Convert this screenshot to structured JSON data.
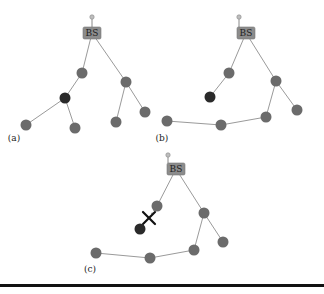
{
  "figure": {
    "panels": [
      {
        "id": "a",
        "label": "(a)",
        "label_pos": [
          14,
          141
        ],
        "bs": {
          "label": "BS",
          "x": 92,
          "y": 33,
          "antenna": [
            92,
            17
          ]
        },
        "nodes": [
          {
            "id": "a1",
            "x": 82,
            "y": 73
          },
          {
            "id": "a2",
            "x": 65,
            "y": 98,
            "failed": true
          },
          {
            "id": "a3",
            "x": 26,
            "y": 125
          },
          {
            "id": "a4",
            "x": 75,
            "y": 128
          },
          {
            "id": "a5",
            "x": 126,
            "y": 82
          },
          {
            "id": "a6",
            "x": 116,
            "y": 122
          },
          {
            "id": "a7",
            "x": 145,
            "y": 112
          }
        ],
        "edges": [
          [
            "bs",
            "a1"
          ],
          [
            "a1",
            "a2"
          ],
          [
            "a2",
            "a3"
          ],
          [
            "a2",
            "a4"
          ],
          [
            "bs",
            "a5"
          ],
          [
            "a5",
            "a6"
          ],
          [
            "a5",
            "a7"
          ]
        ]
      },
      {
        "id": "b",
        "label": "(b)",
        "label_pos": [
          162,
          141
        ],
        "bs": {
          "label": "BS",
          "x": 246,
          "y": 33,
          "antenna": [
            239,
            17
          ]
        },
        "nodes": [
          {
            "id": "b1",
            "x": 229,
            "y": 73
          },
          {
            "id": "b2",
            "x": 210,
            "y": 97,
            "failed": true
          },
          {
            "id": "b3",
            "x": 276,
            "y": 81
          },
          {
            "id": "b4",
            "x": 297,
            "y": 110
          },
          {
            "id": "b5",
            "x": 266,
            "y": 117
          },
          {
            "id": "b6",
            "x": 221,
            "y": 125
          },
          {
            "id": "b7",
            "x": 167,
            "y": 121
          }
        ],
        "edges": [
          [
            "bs",
            "b1"
          ],
          [
            "b1",
            "b2"
          ],
          [
            "bs",
            "b3"
          ],
          [
            "b3",
            "b4"
          ],
          [
            "b3",
            "b5"
          ],
          [
            "b5",
            "b6"
          ],
          [
            "b6",
            "b7"
          ]
        ]
      },
      {
        "id": "c",
        "label": "(c)",
        "label_pos": [
          90,
          272
        ],
        "bs": {
          "label": "BS",
          "x": 176,
          "y": 169,
          "antenna": [
            168,
            155
          ]
        },
        "nodes": [
          {
            "id": "c1",
            "x": 157,
            "y": 206
          },
          {
            "id": "c2",
            "x": 140,
            "y": 229,
            "failed": true
          },
          {
            "id": "c3",
            "x": 204,
            "y": 213
          },
          {
            "id": "c4",
            "x": 223,
            "y": 242
          },
          {
            "id": "c5",
            "x": 194,
            "y": 250
          },
          {
            "id": "c6",
            "x": 150,
            "y": 258
          },
          {
            "id": "c7",
            "x": 96,
            "y": 253
          }
        ],
        "edges": [
          [
            "bs",
            "c1"
          ],
          [
            "bs",
            "c3"
          ],
          [
            "c3",
            "c4"
          ],
          [
            "c3",
            "c5"
          ],
          [
            "c5",
            "c6"
          ],
          [
            "c6",
            "c7"
          ]
        ],
        "broken_link": {
          "from": "c1",
          "to": "c2",
          "mark": "X",
          "x": 149,
          "y": 218
        }
      }
    ],
    "colors": {
      "node": "#6b6b6b",
      "failed_node": "#2a2a2a",
      "edge": "#9a9a9a",
      "bs_box": "#8c8c8c"
    }
  }
}
